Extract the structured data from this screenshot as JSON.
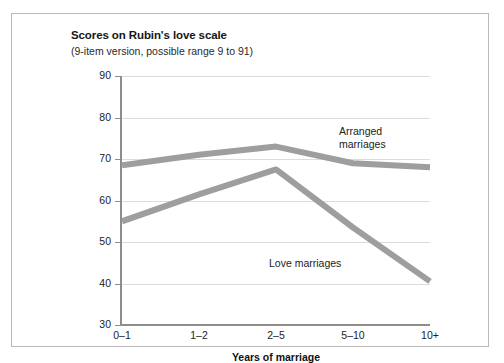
{
  "chart_data": {
    "type": "line",
    "title": "Scores on Rubin's love scale",
    "subtitle": "(9-item version, possible range 9 to 91)",
    "xlabel": "Years of marriage",
    "ylabel": "",
    "categories": [
      "0–1",
      "1–2",
      "2–5",
      "5–10",
      "10+"
    ],
    "ylim": [
      30,
      90
    ],
    "yticks": [
      30,
      40,
      50,
      60,
      70,
      80,
      90
    ],
    "grid": true,
    "legend_position": "inline-annotations",
    "series": [
      {
        "name": "Arranged marriages",
        "values": [
          68.5,
          71,
          73,
          69,
          68
        ],
        "color": "#9e9e9e",
        "annotation": "Arranged\nmarriages"
      },
      {
        "name": "Love marriages",
        "values": [
          55,
          61.5,
          67.5,
          53.5,
          40.5
        ],
        "color": "#9e9e9e",
        "annotation": "Love marriages"
      }
    ]
  },
  "colors": {
    "line": "#9e9e9e",
    "axis": "#8d8d8d",
    "grid": "#dcdcdc",
    "frame": "#b9b9b9",
    "text": "#1d1d1d",
    "background": "#ffffff"
  }
}
